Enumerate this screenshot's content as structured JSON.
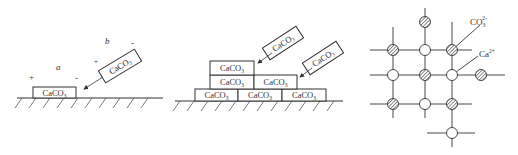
{
  "panel_a": {
    "ground_box_label": "CaCO",
    "ground_box_sub": "3",
    "falling_box_label": "CaCO",
    "falling_box_sub": "3",
    "label_a": "a",
    "label_b": "b",
    "plus_left": "+",
    "minus_left": "-",
    "plus_right": "+",
    "minus_right": "-"
  },
  "panel_b": {
    "box_label": "CaCO",
    "box_sub": "3",
    "stack_rows": [
      1,
      2,
      3
    ],
    "incoming_boxes": 2
  },
  "panel_c": {
    "label_carbonate": "CO",
    "label_carbonate_sub": "3",
    "label_carbonate_sup": "2-",
    "label_calcium": "Ca",
    "label_calcium_sup": "2+"
  },
  "colors": {
    "line": "#333333",
    "hatch": "#444444",
    "background": "#ffffff"
  }
}
